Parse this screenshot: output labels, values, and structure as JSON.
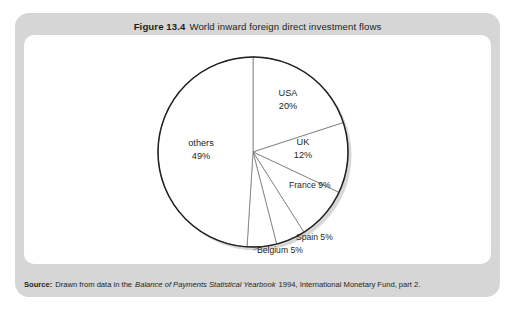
{
  "figure": {
    "number_label": "Figure 13.4",
    "title": "World inward foreign direct investment flows"
  },
  "source": {
    "label": "Source:",
    "lead": "Drawn from data in the",
    "italic_title": "Balance of Payments Statistical Yearbook",
    "rest": "1994, International Monetary Fund, part 2."
  },
  "colors": {
    "frame": "#d6d6d6",
    "panel": "#ffffff",
    "outline": "#231f20",
    "leader_line": "#6e6e6e",
    "shadow": "#c9c9c9",
    "text": "#231f20"
  },
  "chart_data": {
    "type": "pie",
    "title": "World inward foreign direct investment flows",
    "xlabel": "",
    "ylabel": "",
    "legend_position": "none",
    "grid": false,
    "start_angle_deg": 0,
    "direction": "clockwise",
    "unit": "%",
    "categories": [
      "USA",
      "UK",
      "France",
      "Spain",
      "Belgium",
      "others"
    ],
    "values": [
      20,
      12,
      9,
      5,
      5,
      49
    ],
    "slices": [
      {
        "name": "USA",
        "value": 20,
        "label": "USA",
        "value_label": "20%",
        "label_x": 288,
        "label_y": 96,
        "value_x": 288,
        "value_y": 109,
        "label_align": "middle",
        "two_line": true,
        "has_leader": false
      },
      {
        "name": "UK",
        "value": 12,
        "label": "UK",
        "value_label": "12%",
        "label_x": 303,
        "label_y": 145,
        "value_x": 303,
        "value_y": 158,
        "label_align": "middle",
        "two_line": true,
        "has_leader": false
      },
      {
        "name": "France",
        "value": 9,
        "label": "France 9%",
        "value_label": "",
        "label_x": 289,
        "label_y": 188,
        "value_x": 0,
        "value_y": 0,
        "label_align": "start",
        "two_line": false,
        "has_leader": false
      },
      {
        "name": "Spain",
        "value": 5,
        "label": "Spain 5%",
        "value_label": "",
        "label_x": 296,
        "label_y": 240,
        "value_x": 0,
        "value_y": 0,
        "label_align": "start",
        "two_line": false,
        "has_leader": true
      },
      {
        "name": "Belgium",
        "value": 5,
        "label": "Belgium 5%",
        "value_label": "",
        "label_x": 257,
        "label_y": 253,
        "value_x": 0,
        "value_y": 0,
        "label_align": "start",
        "two_line": false,
        "has_leader": true
      },
      {
        "name": "others",
        "value": 49,
        "label": "others",
        "value_label": "49%",
        "label_x": 201,
        "label_y": 146,
        "value_x": 201,
        "value_y": 159,
        "label_align": "middle",
        "two_line": true,
        "has_leader": false
      }
    ],
    "geometry": {
      "cx": 253,
      "cy": 152,
      "r": 95
    }
  }
}
